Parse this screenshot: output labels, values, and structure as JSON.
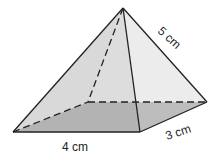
{
  "diagram": {
    "type": "rectangular pyramid",
    "labels": {
      "base_length": "4 cm",
      "base_width": "3 cm",
      "slant_edge": "5 cm"
    },
    "colors": {
      "base": "#a9a9a9",
      "left_face": "#d4d4d4",
      "front_face": "#dcdcdc",
      "right_face": "#e8e8e8",
      "edge": "#222222"
    }
  }
}
